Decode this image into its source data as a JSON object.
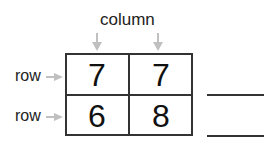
{
  "diagram": {
    "column_label": "column",
    "row_labels": [
      "row",
      "row"
    ],
    "cells": [
      [
        "7",
        "7"
      ],
      [
        "6",
        "8"
      ]
    ],
    "arrow_color": "#c0c0c0",
    "answer_blanks": 2
  }
}
